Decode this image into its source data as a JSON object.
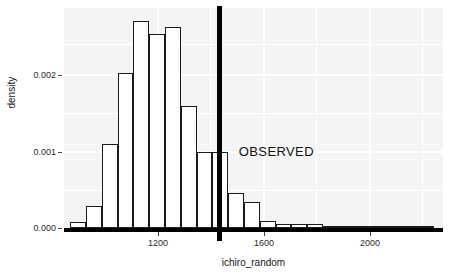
{
  "chart_data": {
    "type": "bar",
    "title": "",
    "subtitle": "",
    "xlabel": "ichiro_random",
    "ylabel": "density",
    "xlim": [
      1030,
      2230
    ],
    "ylim": [
      0,
      0.00288
    ],
    "bin_width": 50,
    "grid": true,
    "legend": "none",
    "legend_position": "none",
    "x_ticks": [
      1200,
      1600,
      2000
    ],
    "x_tick_labels": [
      "1200",
      "1600",
      "2000"
    ],
    "y_ticks": [
      0.0,
      0.001,
      0.002
    ],
    "y_tick_labels": [
      "0.000",
      "0.001",
      "0.002"
    ],
    "bin_starts": [
      1050,
      1100,
      1150,
      1200,
      1250,
      1300,
      1350,
      1400,
      1450,
      1500,
      1550,
      1600,
      1650,
      1700,
      1750,
      1800,
      1850,
      1900,
      1950,
      2000,
      2050,
      2100,
      2150
    ],
    "categories": [
      "1050-1100",
      "1100-1150",
      "1150-1200",
      "1200-1250",
      "1250-1300",
      "1300-1350",
      "1350-1400",
      "1400-1450",
      "1450-1500",
      "1500-1550",
      "1550-1600",
      "1600-1650",
      "1650-1700",
      "1700-1750",
      "1750-1800",
      "1800-1850",
      "1850-1900",
      "1900-1950",
      "1950-2000",
      "2000-2050",
      "2050-2100",
      "2100-2150",
      "2150-2200"
    ],
    "values": [
      8e-05,
      0.00029,
      0.00112,
      0.00207,
      0.00276,
      0.00259,
      0.00268,
      0.00163,
      0.00101,
      0.00101,
      0.00047,
      0.00035,
      9e-05,
      6e-05,
      5e-05,
      5e-05,
      0.0,
      0.0,
      0.0,
      0.0,
      2e-05,
      0.0,
      0.0
    ],
    "annotations": [
      {
        "name": "observed-vline",
        "type": "vline",
        "x": 1520,
        "label": "OBSERVED",
        "color": "#000000"
      }
    ]
  },
  "axes": {
    "y_title": "density",
    "x_title": "ichiro_random",
    "y_ticks": [
      {
        "label": "0.002",
        "value": 0.002
      },
      {
        "label": "0.001",
        "value": 0.001
      },
      {
        "label": "0.000",
        "value": 0.0
      }
    ],
    "x_ticks": [
      {
        "label": "1200",
        "value": 1200
      },
      {
        "label": "1600",
        "value": 1600
      },
      {
        "label": "2000",
        "value": 2000
      }
    ]
  },
  "annotation": {
    "observed_label": "OBSERVED"
  },
  "colors": {
    "panel_background": "#f4f4f4",
    "grid": "#ffffff",
    "bar_fill": "#ffffff",
    "bar_stroke": "#1b1b1b",
    "observed_line": "#000000",
    "text": "#151515",
    "page_background": "#ffffff"
  }
}
